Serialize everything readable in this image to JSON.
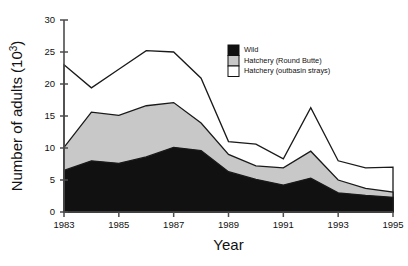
{
  "chart_data": {
    "type": "area",
    "stacked": true,
    "title": "",
    "xlabel": "Year",
    "ylabel": "Number of adults (10³)",
    "xlim": [
      1983,
      1995
    ],
    "ylim": [
      0,
      30
    ],
    "xticks": [
      1983,
      1985,
      1987,
      1989,
      1991,
      1993,
      1995
    ],
    "xtick_labels": [
      "1983",
      "1985",
      "1987",
      "1989",
      "1991",
      "1993",
      "1995"
    ],
    "yticks": [
      0,
      5,
      10,
      15,
      20,
      25,
      30
    ],
    "ytick_labels": [
      "0",
      "5",
      "10",
      "15",
      "20",
      "25",
      "30"
    ],
    "grid": false,
    "legend_position": "upper right",
    "x": [
      1983,
      1984,
      1985,
      1986,
      1987,
      1988,
      1989,
      1990,
      1991,
      1992,
      1993,
      1994,
      1995
    ],
    "series": [
      {
        "name": "Wild",
        "color": "#111111",
        "values": [
          6.5,
          8.0,
          7.6,
          8.6,
          10.1,
          9.6,
          6.3,
          5.1,
          4.2,
          5.3,
          3.0,
          2.6,
          2.3
        ]
      },
      {
        "name": "Hatchery (Round Butte)",
        "color": "#c8c8c8",
        "values": [
          3.6,
          7.6,
          7.5,
          8.0,
          7.0,
          4.3,
          2.7,
          2.1,
          2.7,
          4.2,
          2.0,
          1.1,
          0.8
        ]
      },
      {
        "name": "Hatchery (outbasin strays)",
        "color": "#ffffff",
        "values": [
          12.9,
          3.8,
          7.2,
          8.6,
          7.9,
          7.0,
          2.0,
          3.4,
          1.4,
          6.8,
          3.0,
          3.2,
          3.9
        ]
      }
    ],
    "totals": [
      23.0,
      19.4,
      22.3,
      25.2,
      25.0,
      20.9,
      11.0,
      10.6,
      8.3,
      16.3,
      8.0,
      6.9,
      7.0
    ],
    "annotations": []
  },
  "legend": {
    "entries": [
      {
        "label": "Wild",
        "color": "#111111"
      },
      {
        "label": "Hatchery (Round Butte)",
        "color": "#c8c8c8"
      },
      {
        "label": "Hatchery (outbasin strays)",
        "color": "#ffffff"
      }
    ]
  },
  "colors": {
    "wild": "#111111",
    "round_butte": "#c8c8c8",
    "outbasin": "#ffffff",
    "axis": "#4d4d4d",
    "outline": "#1a1a1a",
    "background": "#ffffff"
  }
}
